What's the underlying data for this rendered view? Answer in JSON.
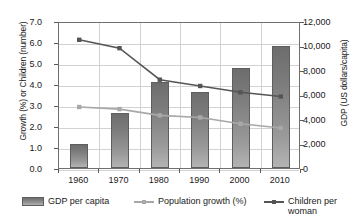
{
  "chart_data": {
    "type": "bar",
    "title": "",
    "subtitle": "",
    "categories": [
      "1960",
      "1970",
      "1980",
      "1990",
      "2000",
      "2010"
    ],
    "xlabel": "",
    "ylabel": "Growth (%) or Children (number)",
    "y2label": "GDP (US dollars/capita)",
    "ylim": [
      0,
      7
    ],
    "y2lim": [
      0,
      12000
    ],
    "grid": true,
    "legend_position": "bottom",
    "yticks": [
      "0.0",
      "1.0",
      "2.0",
      "3.0",
      "4.0",
      "5.0",
      "6.0",
      "7.0"
    ],
    "y2ticks": [
      "0",
      "2,000",
      "4,000",
      "6,000",
      "8,000",
      "10,000",
      "12,000"
    ],
    "series": [
      {
        "name": "GDP per capita",
        "kind": "bar",
        "axis": "right",
        "unit": "US dollars/capita",
        "color": "#8d8d8d",
        "values": [
          2000,
          4500,
          7000,
          6200,
          8200,
          10000
        ]
      },
      {
        "name": "Population growth (%)",
        "kind": "line",
        "axis": "left",
        "unit": "%",
        "color": "#a8a8a8",
        "values": [
          3.0,
          2.9,
          2.6,
          2.5,
          2.2,
          2.0
        ]
      },
      {
        "name": "Children per woman",
        "kind": "line",
        "axis": "left",
        "unit": "children",
        "color": "#555555",
        "values": [
          6.2,
          5.8,
          4.3,
          4.0,
          3.7,
          3.5
        ]
      }
    ]
  },
  "axes": {
    "left_title": "Growth (%) or Children (number)",
    "right_title": "GDP (US dollars/capita)",
    "left_ticks": [
      "7.0",
      "6.0",
      "5.0",
      "4.0",
      "3.0",
      "2.0",
      "1.0",
      "0.0"
    ],
    "right_ticks": [
      "12,000",
      "10,000",
      "8,000",
      "6,000",
      "4,000",
      "2,000",
      "0"
    ],
    "x_ticks": [
      "1960",
      "1970",
      "1980",
      "1990",
      "2000",
      "2010"
    ]
  },
  "legend": {
    "items": [
      {
        "label": "GDP per capita",
        "marker": "bar-swatch",
        "color": "#8d8d8d"
      },
      {
        "label": "Population growth (%)",
        "marker": "line-marker",
        "color": "#a8a8a8"
      },
      {
        "label": "Children per\nwoman",
        "marker": "line-marker",
        "color": "#555555"
      }
    ]
  }
}
